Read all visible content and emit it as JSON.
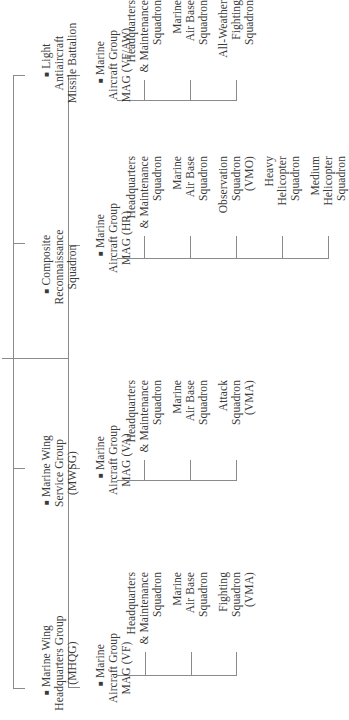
{
  "diagram": {
    "type": "org-chart",
    "orientation": "rotated-90-ccw",
    "line_color": "#8a8a8a",
    "text_color": "#3a3a3a",
    "top_level_units": [
      {
        "id": "mhqg",
        "label": "Marine Wing\nHeadquarters Group\n(MHQG)",
        "bullet": "■",
        "children": []
      },
      {
        "id": "mwsg",
        "label": "Marine Wing\nService Group\n(MWSG)",
        "bullet": "■",
        "children": []
      },
      {
        "id": "crs",
        "label": "Composite\nReconnaissance\nSquadron",
        "bullet": "■",
        "children": []
      },
      {
        "id": "laam",
        "label": "Light\nAntiaircraft\nMissile Battalion",
        "bullet": "■",
        "children": []
      }
    ],
    "aircraft_groups": [
      {
        "id": "mag-vf",
        "label": "Marine\nAircraft Group\nMAG (VF)",
        "bullet": "■",
        "squadrons": [
          "Headquarters\n& Maintenance\nSquadron",
          "Marine\nAir Base\nSquadron",
          "Fighting\nSquadron\n(VMA)"
        ]
      },
      {
        "id": "mag-va",
        "label": "Marine\nAircraft Group\nMAG (VA)",
        "bullet": "■",
        "squadrons": [
          "Headquarters\n& Maintenance\nSquadron",
          "Marine\nAir Base\nSquadron",
          "Attack\nSquadron\n(VMA)"
        ]
      },
      {
        "id": "mag-hr",
        "label": "Marine\nAircraft Group\nMAG (HR)",
        "bullet": "■",
        "squadrons": [
          "Headquarters\n& Maintenance\nSquadron",
          "Marine\nAir Base\nSquadron",
          "Observation\nSquadron\n(VMO)",
          "Heavy\nHelicopter\nSquadron",
          "Medium\nHelicopter\nSquadron"
        ]
      },
      {
        "id": "mag-vfaw",
        "label": "Marine\nAircraft Group\nMAG (VF/AW)",
        "bullet": "■",
        "squadrons": [
          "Headquarters\n& Maintenance\nSquadron",
          "Marine\nAir Base\nSquadron",
          "All-Weather\nFighting\nSquadron"
        ]
      }
    ]
  }
}
